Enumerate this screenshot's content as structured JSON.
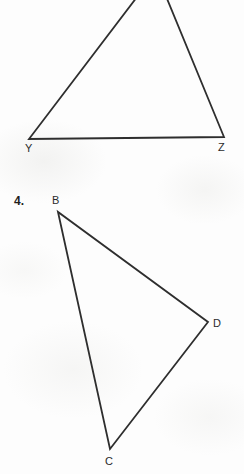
{
  "page": {
    "width": 244,
    "height": 474,
    "background_color": "#fdfdfd",
    "ink_color": "#2b2b2b"
  },
  "figures": [
    {
      "id": "figure-top",
      "shape": "triangle",
      "note": "apex cropped above top edge of image",
      "stroke_color": "#2e2e2e",
      "stroke_width": 1.8,
      "vertices": [
        {
          "label": "A",
          "visible_label": false,
          "x": 156,
          "y": -28
        },
        {
          "label": "Y",
          "visible_label": true,
          "x": 29,
          "y": 139,
          "label_x": 25,
          "label_y": 143
        },
        {
          "label": "Z",
          "visible_label": true,
          "x": 224,
          "y": 137,
          "label_x": 218,
          "label_y": 142
        }
      ],
      "labels": [
        {
          "text": "Y",
          "x": 25,
          "y": 143
        },
        {
          "text": "Z",
          "x": 218,
          "y": 142
        }
      ]
    },
    {
      "id": "figure-4",
      "number": "4.",
      "number_x": 14,
      "number_y": 195,
      "shape": "triangle",
      "stroke_color": "#2e2e2e",
      "stroke_width": 1.8,
      "vertices": [
        {
          "label": "B",
          "visible_label": true,
          "x": 58,
          "y": 212,
          "label_x": 52,
          "label_y": 195
        },
        {
          "label": "C",
          "visible_label": true,
          "x": 110,
          "y": 449,
          "label_x": 105,
          "label_y": 456
        },
        {
          "label": "D",
          "visible_label": true,
          "x": 208,
          "y": 322,
          "label_x": 213,
          "label_y": 318
        }
      ],
      "labels": [
        {
          "text": "B",
          "x": 52,
          "y": 195
        },
        {
          "text": "D",
          "x": 213,
          "y": 318
        },
        {
          "text": "C",
          "x": 105,
          "y": 456
        }
      ]
    }
  ]
}
